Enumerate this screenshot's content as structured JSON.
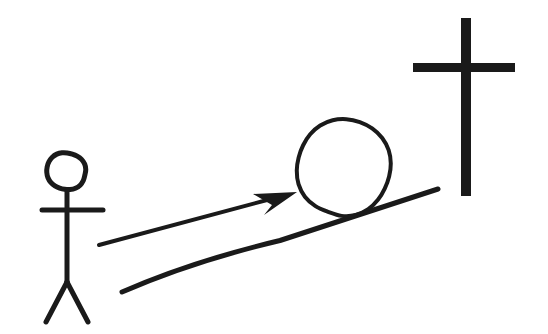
{
  "scene": {
    "title": "Stick figure pushing a ball up a slope toward a cross",
    "background_color": "#ffffff",
    "ink_color": "#1a1a1a",
    "width": 548,
    "height": 334
  },
  "figure": {
    "label": "stick-figure-person",
    "head": {
      "cx": 66,
      "cy": 171,
      "rx": 19,
      "ry": 19
    },
    "neck": {
      "x1": 67,
      "y1": 190,
      "x2": 67,
      "y2": 282
    },
    "arms": {
      "x1": 42,
      "y1": 210,
      "x2": 103,
      "y2": 210
    },
    "leg_left": {
      "x1": 67,
      "y1": 282,
      "x2": 46,
      "y2": 322
    },
    "leg_right": {
      "x1": 67,
      "y1": 282,
      "x2": 88,
      "y2": 322
    },
    "stroke_width": 5
  },
  "arrow": {
    "label": "push-direction-arrow",
    "tail": {
      "x": 99,
      "y": 245
    },
    "tip": {
      "x": 297,
      "y": 192
    },
    "stroke_width": 4,
    "head_points": "297,192 253,194 272,205 264,215"
  },
  "ball": {
    "label": "boulder-circle",
    "cx": 344,
    "cy": 167,
    "rx": 47,
    "ry": 48,
    "stroke_width": 4
  },
  "slope": {
    "label": "hill-slope-line",
    "start": {
      "x": 122,
      "y": 292
    },
    "end": {
      "x": 438,
      "y": 189
    },
    "stroke_width": 5
  },
  "cross": {
    "label": "cross-symbol",
    "vertical": {
      "x": 461,
      "y": 18,
      "width": 10,
      "height": 178
    },
    "horizontal": {
      "x": 413,
      "y": 63,
      "width": 102,
      "height": 9
    }
  }
}
